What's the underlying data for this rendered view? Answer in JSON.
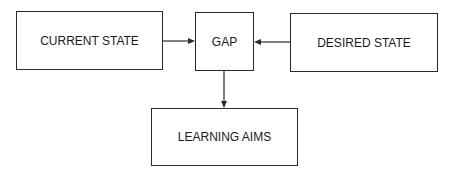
{
  "diagram": {
    "nodes": {
      "current": {
        "label": "CURRENT STATE"
      },
      "gap": {
        "label": "GAP"
      },
      "desired": {
        "label": "DESIRED STATE"
      },
      "learning": {
        "label": "LEARNING AIMS"
      }
    },
    "edges": [
      {
        "from": "CURRENT STATE",
        "to": "GAP"
      },
      {
        "from": "DESIRED STATE",
        "to": "GAP"
      },
      {
        "from": "GAP",
        "to": "LEARNING AIMS"
      }
    ]
  }
}
